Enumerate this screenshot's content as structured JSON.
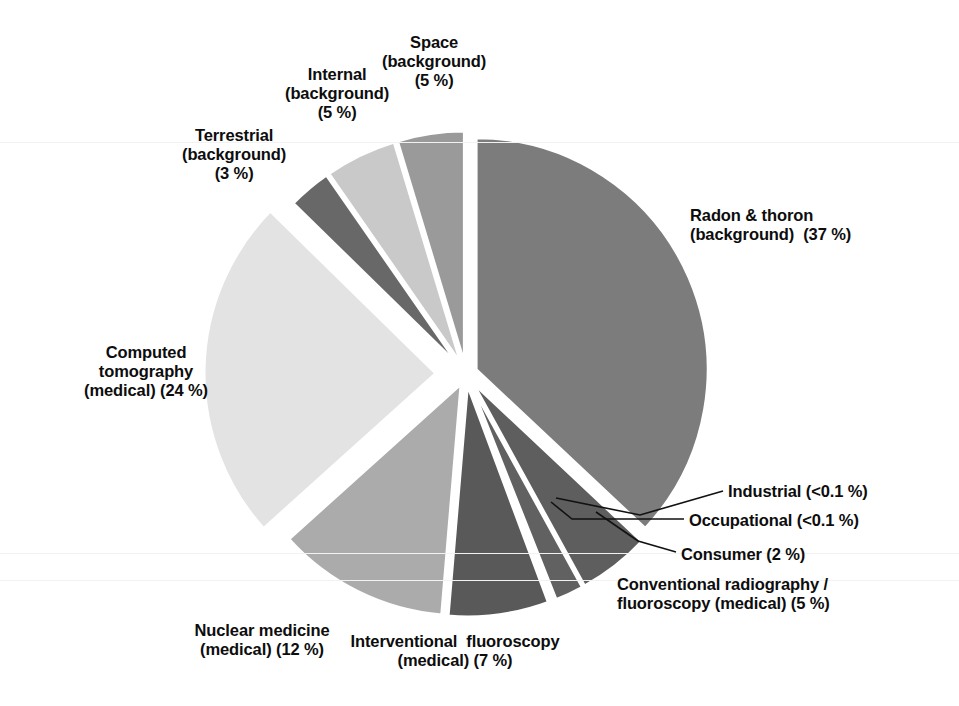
{
  "figure": {
    "background_color": "#ffffff",
    "text_color": "#0d0d0d",
    "gap_color": "#ffffff",
    "leader_line_color": "#111111"
  },
  "chart_data": {
    "type": "pie",
    "title": "",
    "subtitle": "",
    "xlabel": "",
    "ylabel": "",
    "units": "percent of total effective dose",
    "legend_position": "none (direct labels with leader lines)",
    "grid": false,
    "exploded": true,
    "start_angle_deg": 0,
    "direction": "clockwise",
    "total": 100,
    "categories": [
      "Radon & thoron (background)",
      "Conventional radiography / fluoroscopy (medical)",
      "Consumer",
      "Occupational",
      "Industrial",
      "Interventional fluoroscopy (medical)",
      "Nuclear medicine (medical)",
      "Computed tomography (medical)",
      "Terrestrial (background)",
      "Internal (background)",
      "Space (background)"
    ],
    "values": [
      37,
      5,
      2,
      0.1,
      0.1,
      7,
      12,
      24,
      3,
      5,
      5
    ],
    "value_labels": [
      "37 %",
      "5 %",
      "2 %",
      "<0.1 %",
      "<0.1 %",
      "7 %",
      "12 %",
      "24 %",
      "3 %",
      "5 %",
      "5 %"
    ],
    "colors": [
      "#7c7c7c",
      "#5e5e5e",
      "#616161",
      "#4f4f4f",
      "#4f4f4f",
      "#595959",
      "#ababab",
      "#e3e3e3",
      "#686868",
      "#c9c9c9",
      "#9a9a9a"
    ],
    "slices": [
      {
        "key": "radon-thoron",
        "name": "Radon & thoron",
        "qualifier": "(background)",
        "value": 37,
        "value_label": "(37 %)",
        "color": "#7c7c7c",
        "start_deg": 0,
        "sweep_deg": 133.2,
        "explode": 11,
        "label_lines": [
          "Radon & thoron",
          "(background)  (37 %)"
        ],
        "label_x": 690,
        "label_y": 206,
        "label_align": "left",
        "leader": false
      },
      {
        "key": "conventional-radiography-fluoroscopy",
        "name": "Conventional radiography /",
        "qualifier": "fluoroscopy (medical)",
        "value": 5,
        "value_label": "(5 %)",
        "color": "#5e5e5e",
        "start_deg": 133.2,
        "sweep_deg": 18.0,
        "explode": 11,
        "label_lines": [
          "Conventional radiography /",
          "fluoroscopy (medical) (5 %)"
        ],
        "label_x": 617,
        "label_y": 575,
        "label_align": "left",
        "leader": false
      },
      {
        "key": "consumer",
        "name": "Consumer",
        "qualifier": "",
        "value": 2,
        "value_label": "(2 %)",
        "color": "#616161",
        "start_deg": 151.2,
        "sweep_deg": 7.2,
        "explode": 11,
        "label_lines": [
          "Consumer (2 %)"
        ],
        "label_x": 681,
        "label_y": 545,
        "label_align": "left",
        "leader": true,
        "leader_path": "M 676 552 L 638 541 L 596 512"
      },
      {
        "key": "occupational",
        "name": "Occupational",
        "qualifier": "",
        "value": 0.1,
        "value_label": "(<0.1 %)",
        "color": "#4f4f4f",
        "start_deg": 158.4,
        "sweep_deg": 0.6,
        "explode": 11,
        "label_lines": [
          "Occupational (<0.1 %)"
        ],
        "label_x": 689,
        "label_y": 511,
        "label_align": "left",
        "leader": true,
        "leader_path": "M 684 519 L 572 519 L 551 502"
      },
      {
        "key": "industrial",
        "name": "Industrial",
        "qualifier": "",
        "value": 0.1,
        "value_label": "(<0.1 %)",
        "color": "#4f4f4f",
        "start_deg": 159.0,
        "sweep_deg": 0.6,
        "explode": 11,
        "label_lines": [
          "Industrial (<0.1 %)"
        ],
        "label_x": 728,
        "label_y": 482,
        "label_align": "left",
        "leader": true,
        "leader_path": "M 723 491 L 640 515 L 556 498"
      },
      {
        "key": "interventional-fluoroscopy",
        "name": "Interventional fluoroscopy",
        "qualifier": "(medical)",
        "value": 7,
        "value_label": "(7 %)",
        "color": "#595959",
        "start_deg": 159.6,
        "sweep_deg": 25.2,
        "explode": 11,
        "label_lines": [
          "Interventional  fluoroscopy",
          "(medical) (7 %)"
        ],
        "label_x": 455,
        "label_y": 632,
        "label_align": "center",
        "leader": false
      },
      {
        "key": "nuclear-medicine",
        "name": "Nuclear medicine",
        "qualifier": "(medical)",
        "value": 12,
        "value_label": "(12 %)",
        "color": "#ababab",
        "start_deg": 184.8,
        "sweep_deg": 43.2,
        "explode": 11,
        "label_lines": [
          "Nuclear medicine",
          "(medical) (12 %)"
        ],
        "label_x": 262,
        "label_y": 621,
        "label_align": "center",
        "leader": false
      },
      {
        "key": "computed-tomography",
        "name": "Computed tomography",
        "qualifier": "(medical)",
        "value": 24,
        "value_label": "(24 %)",
        "color": "#e3e3e3",
        "start_deg": 228.0,
        "sweep_deg": 86.4,
        "explode": 30,
        "label_lines": [
          "Computed",
          "tomography",
          "(medical) (24 %)"
        ],
        "label_x": 146,
        "label_y": 343,
        "label_align": "center",
        "leader": false
      },
      {
        "key": "terrestrial",
        "name": "Terrestrial",
        "qualifier": "(background)",
        "value": 3,
        "value_label": "(3 %)",
        "color": "#686868",
        "start_deg": 314.4,
        "sweep_deg": 10.8,
        "explode": 11,
        "label_lines": [
          "Terrestrial",
          "(background)",
          "(3 %)"
        ],
        "label_x": 234,
        "label_y": 126,
        "label_align": "center",
        "leader": false
      },
      {
        "key": "internal",
        "name": "Internal",
        "qualifier": "(background)",
        "value": 5,
        "value_label": "(5 %)",
        "color": "#c9c9c9",
        "start_deg": 325.2,
        "sweep_deg": 18.0,
        "explode": 11,
        "label_lines": [
          "Internal",
          "(background)",
          "(5 %)"
        ],
        "label_x": 337,
        "label_y": 65,
        "label_align": "center",
        "leader": false
      },
      {
        "key": "space",
        "name": "Space",
        "qualifier": "(background)",
        "value": 5,
        "value_label": "(5 %)",
        "color": "#9a9a9a",
        "start_deg": 343.2,
        "sweep_deg": 16.8,
        "explode": 11,
        "label_lines": [
          "Space",
          "(background)",
          "(5 %)"
        ],
        "label_x": 434,
        "label_y": 33,
        "label_align": "center",
        "leader": false
      }
    ],
    "geometry": {
      "center_x": 466,
      "center_y": 374,
      "radius": 232
    },
    "scanlines_y": [
      142,
      553,
      580
    ]
  }
}
